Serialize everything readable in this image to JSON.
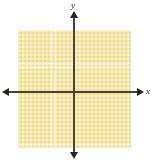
{
  "figure": {
    "kind": "cartesian-coordinate-plane",
    "background_color": "#ffffff"
  },
  "axes": {
    "x_label": "x",
    "y_label": "y",
    "line_color": "#4b4036",
    "arrow_color": "#262220",
    "x_arrow_left_icon": "arrow-left-icon",
    "x_arrow_right_icon": "arrow-right-icon",
    "y_arrow_top_icon": "arrow-up-icon",
    "y_arrow_bottom_icon": "arrow-down-icon"
  },
  "shaded_region": {
    "fill_color": "#ecdd8c",
    "gridline_color": "#f7f0c6"
  },
  "chart_data": {
    "type": "area",
    "title": "",
    "xlabel": "x",
    "ylabel": "y",
    "grid": true,
    "legend": "none",
    "xlim": [
      -14,
      14
    ],
    "ylim": [
      -14,
      15
    ],
    "shaded_regions": [
      {
        "label": "",
        "fill": "#ecdd8c",
        "x_range": [
          -14,
          14
        ],
        "y_range": [
          -14,
          15
        ],
        "description": "entire rectangular window shaded with yellow grid pattern"
      }
    ],
    "series": [],
    "x": [],
    "values": [],
    "annotations": []
  }
}
